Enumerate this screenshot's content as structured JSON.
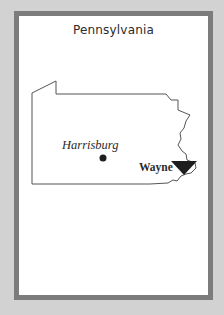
{
  "card": {
    "title": "Pennsylvania"
  },
  "map": {
    "state": "Pennsylvania",
    "cities": [
      {
        "name": "Harrisburg",
        "marker": "dot",
        "style": "italic"
      },
      {
        "name": "Wayne",
        "marker": "triangle-down",
        "style": "bold"
      }
    ]
  },
  "colors": {
    "background": "#d2d2d2",
    "card_border": "#7c7c7c",
    "card_fill": "#ffffff",
    "outline": "#555555",
    "marker": "#1e1e1e",
    "text": "#2b2b2b"
  }
}
